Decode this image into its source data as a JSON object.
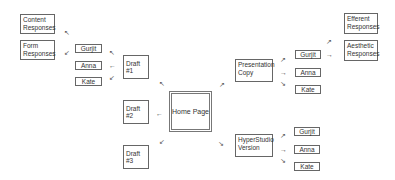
{
  "home": {
    "label": "Home Page"
  },
  "drafts": [
    {
      "label": "Draft #1"
    },
    {
      "label": "Draft #2"
    },
    {
      "label": "Draft #3"
    }
  ],
  "draft1_students": [
    "Gurjit",
    "Anna",
    "Kate"
  ],
  "draft1_responses": [
    "Content Responses",
    "Form Responses"
  ],
  "presentation": {
    "label": "Presentation Copy",
    "students": [
      "Gurjit",
      "Anna",
      "Kate"
    ]
  },
  "presentation_responses": [
    "Efferent Responses",
    "Aesthetic Responses"
  ],
  "hyperstudio": {
    "label": "HyperStudio Version",
    "students": [
      "Gurjit",
      "Anna",
      "Kate"
    ]
  },
  "arrows": {
    "nw": "↖",
    "ne": "↗",
    "sw": "↙",
    "se": "↘",
    "w": "←",
    "e": "→"
  }
}
